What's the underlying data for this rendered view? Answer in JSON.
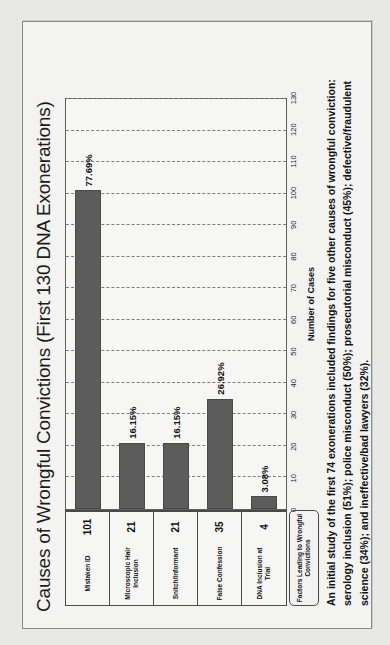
{
  "slide": {
    "title": "Causes of Wrongful Convictions (First 130 DNA Exonerations)",
    "footnote": "An initial study of the first 74 exonerations included findings for five other causes of wrongful conviction: serology inclusion (51%); police misconduct (50%); prosecutorial misconduct (45%); defective/fraudulent science (34%); and ineffective/bad lawyers (32%)."
  },
  "table": {
    "header": "Factors Leading to Wrongful Convictions"
  },
  "chart_data": {
    "type": "bar",
    "title": "Causes of Wrongful Convictions (First 130 DNA Exonerations)",
    "orientation": "horizontal",
    "categories": [
      "Mistaken ID",
      "Microscopic Hair Inclusion",
      "Snitch/Informant",
      "False Confession",
      "DNA Inclusion at Trial"
    ],
    "values": [
      101,
      21,
      21,
      35,
      4
    ],
    "value_labels": [
      "101",
      "21",
      "21",
      "35",
      "4"
    ],
    "percent_labels": [
      "77.69%",
      "16.15%",
      "16.15%",
      "26.92%",
      "3.08%"
    ],
    "xlabel": "Number of Cases",
    "ylabel": "",
    "xlim": [
      0,
      130
    ],
    "xticks": [
      0,
      10,
      20,
      30,
      40,
      50,
      60,
      70,
      80,
      90,
      100,
      110,
      120,
      130
    ],
    "xtick_labels": [
      "0",
      "10",
      "20",
      "30",
      "40",
      "50",
      "60",
      "70",
      "80",
      "90",
      "100",
      "110",
      "120",
      "130"
    ],
    "grid": true,
    "grid_style": "dashed-vertical",
    "legend": "none",
    "series": [
      {
        "name": "Number of Cases",
        "values": [
          101,
          21,
          21,
          35,
          4
        ],
        "color": "#5c5c5c"
      }
    ],
    "total_exonerations": 130
  },
  "colors": {
    "bar": "#5c5c5c",
    "plot_background": "#f6f6f4",
    "slide_background": "#f3f3f1",
    "page_background": "#e8e8e6",
    "grid": "#7d7d7d",
    "text": "#111111"
  }
}
